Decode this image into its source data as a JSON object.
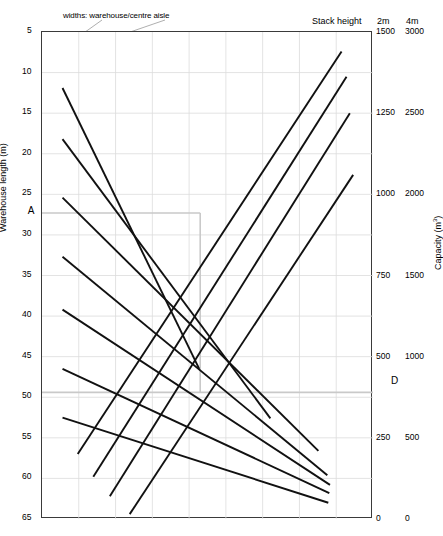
{
  "chart_data": {
    "type": "line",
    "title": "",
    "annotation_top_left": "widths: warehouse/centre aisle",
    "stack_header": {
      "label": "Stack height",
      "col1": "2m",
      "col2": "4m"
    },
    "xlabel": "",
    "ylabel": "Warehouse length (m)",
    "y2label": "Capacity (m³)",
    "ylim": [
      5,
      65
    ],
    "y_ticks": [
      5,
      10,
      15,
      20,
      25,
      30,
      35,
      40,
      45,
      50,
      55,
      60,
      65
    ],
    "y2_ticks_2m": [
      1500,
      1250,
      1000,
      750,
      500,
      250,
      0
    ],
    "y2_ticks_4m": [
      3000,
      2500,
      2000,
      1500,
      1000,
      500,
      0
    ],
    "grid": true,
    "legend_position": "inline",
    "width_labels": [
      {
        "text": "22/4",
        "y": 10.0
      },
      {
        "text": "20/2",
        "y": 11.6
      },
      {
        "text": "20/4",
        "y": 16.3
      },
      {
        "text": "18/2",
        "y": 17.9
      },
      {
        "text": "18/4",
        "y": 23.5
      },
      {
        "text": "16/2",
        "y": 25.1
      },
      {
        "text": "16/4",
        "y": 30.8
      },
      {
        "text": "14/2",
        "y": 32.4
      },
      {
        "text": "12/2",
        "y": 37.3
      },
      {
        "text": "10/0",
        "y": 38.9
      },
      {
        "text": "10/2",
        "y": 44.6
      },
      {
        "text": "8/0",
        "y": 46.2
      },
      {
        "text": "8/2",
        "y": 50.6
      },
      {
        "text": "6/0",
        "y": 52.2
      }
    ],
    "descending_series": [
      {
        "name": "20/2",
        "x0": 0.062,
        "y0": 11.9,
        "x1": 0.475,
        "y1": 46.5
      },
      {
        "name": "18/2",
        "x0": 0.062,
        "y0": 18.2,
        "x1": 0.69,
        "y1": 52.6
      },
      {
        "name": "16/2",
        "x0": 0.062,
        "y0": 25.4,
        "x1": 0.835,
        "y1": 56.6
      },
      {
        "name": "14/2",
        "x0": 0.062,
        "y0": 32.7,
        "x1": 0.862,
        "y1": 59.6
      },
      {
        "name": "10/0",
        "x0": 0.062,
        "y0": 39.2,
        "x1": 0.87,
        "y1": 60.8
      },
      {
        "name": "8/0",
        "x0": 0.062,
        "y0": 46.5,
        "x1": 0.868,
        "y1": 61.8
      },
      {
        "name": "6/0",
        "x0": 0.062,
        "y0": 52.5,
        "x1": 0.865,
        "y1": 63.0
      }
    ],
    "ascending_series": [
      {
        "name": "camp foodstore",
        "label": "camp foodstore",
        "x0": 0.108,
        "y0": 57.0,
        "x1": 0.905,
        "y1": 7.4
      },
      {
        "name": "medium foodstore",
        "label": "medium\nfoodstore",
        "x0": 0.155,
        "y0": 59.8,
        "x1": 0.92,
        "y1": 10.5
      },
      {
        "name": "mixed goods store",
        "label": "mixed goods store",
        "x0": 0.205,
        "y0": 62.2,
        "x1": 0.93,
        "y1": 15.0
      },
      {
        "name": "regional warehouse",
        "label": "regional warehouse",
        "x0": 0.265,
        "y0": 64.4,
        "x1": 0.94,
        "y1": 22.6
      }
    ],
    "construction_markers": [
      {
        "label": "A",
        "x": -0.052,
        "y": 27.3
      },
      {
        "label": "B",
        "x": 0.478,
        "y": 27.3
      },
      {
        "label": "C",
        "x": 0.435,
        "y": 49.4
      },
      {
        "label": "D",
        "x": 1.045,
        "y": 48.2
      }
    ],
    "construction_rect": {
      "x_left": 0.0,
      "x_right": 0.478,
      "y_top": 27.3,
      "y_bottom": 49.4,
      "extend_right_to": 1.0,
      "color": "#c9c9c9"
    },
    "callout": {
      "text": "widths: warehouse/centre aisle",
      "leader_targets": [
        {
          "x": 0.012,
          "y": 10.2
        },
        {
          "x": 0.012,
          "y": 10.2
        }
      ]
    }
  }
}
